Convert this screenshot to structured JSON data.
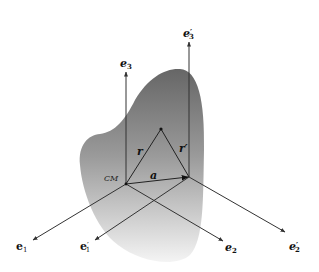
{
  "diagram": {
    "title": "",
    "body": {
      "name": "rigid-body",
      "gradient_top": "#6e6e6e",
      "gradient_bottom": "#f2f2f2"
    },
    "frames": [
      {
        "name": "center-of-mass-frame",
        "origin_label": "CM",
        "axes": [
          {
            "label": "e",
            "sub": "1",
            "prime": ""
          },
          {
            "label": "e",
            "sub": "2",
            "prime": ""
          },
          {
            "label": "e",
            "sub": "3",
            "prime": ""
          }
        ]
      },
      {
        "name": "displaced-frame",
        "origin_label": "",
        "axes": [
          {
            "label": "e",
            "sub": "1",
            "prime": "′"
          },
          {
            "label": "e",
            "sub": "2",
            "prime": "′"
          },
          {
            "label": "e",
            "sub": "3",
            "prime": "′"
          }
        ]
      }
    ],
    "vectors": {
      "r": "r",
      "r_prime": "r′",
      "a": "a"
    },
    "line_color": "#333333"
  }
}
